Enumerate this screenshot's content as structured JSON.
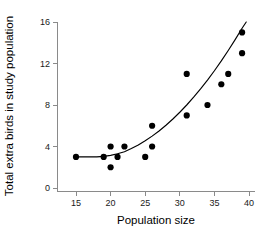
{
  "chart_data": {
    "type": "scatter",
    "title": "",
    "xlabel": "Population size",
    "ylabel": "Total extra birds in study population",
    "xlim": [
      13,
      41
    ],
    "ylim": [
      0,
      16
    ],
    "xticks": [
      15,
      20,
      25,
      30,
      35,
      40
    ],
    "yticks": [
      0,
      4,
      8,
      12,
      16
    ],
    "grid": false,
    "legend": null,
    "marker_color": "#000000",
    "axis_color": "#8a8a8a",
    "curve_color": "#000000",
    "x": [
      15,
      19,
      20,
      20,
      21,
      22,
      25,
      26,
      26,
      31,
      31,
      34,
      36,
      37,
      39,
      39
    ],
    "y": [
      3,
      3,
      4,
      2,
      3,
      4,
      3,
      6,
      4,
      11,
      7,
      8,
      10,
      11,
      15,
      13
    ],
    "points": [
      {
        "x": 15,
        "y": 3
      },
      {
        "x": 19,
        "y": 3
      },
      {
        "x": 20,
        "y": 4
      },
      {
        "x": 20,
        "y": 2
      },
      {
        "x": 21,
        "y": 3
      },
      {
        "x": 22,
        "y": 4
      },
      {
        "x": 25,
        "y": 3
      },
      {
        "x": 26,
        "y": 6
      },
      {
        "x": 26,
        "y": 4
      },
      {
        "x": 31,
        "y": 11
      },
      {
        "x": 31,
        "y": 7
      },
      {
        "x": 34,
        "y": 8
      },
      {
        "x": 36,
        "y": 10
      },
      {
        "x": 37,
        "y": 11
      },
      {
        "x": 39,
        "y": 15
      },
      {
        "x": 39,
        "y": 13
      }
    ],
    "fit_curve": {
      "name": "fitted exponential trend",
      "x": [
        15,
        16,
        17,
        18,
        19,
        20,
        21,
        22,
        23,
        24,
        25,
        26,
        27,
        28,
        29,
        30,
        31,
        32,
        33,
        34,
        35,
        36,
        37,
        38,
        39,
        39.6
      ],
      "y": [
        3.0,
        3.0,
        3.0,
        3.0,
        3.05,
        3.15,
        3.3,
        3.5,
        3.8,
        4.15,
        4.55,
        5.0,
        5.5,
        6.05,
        6.65,
        7.3,
        8.0,
        8.75,
        9.55,
        10.4,
        11.3,
        12.25,
        13.25,
        14.3,
        15.4,
        16.0
      ]
    }
  },
  "ticks": {
    "x": [
      "15",
      "20",
      "25",
      "30",
      "35",
      "40"
    ],
    "y": [
      "0",
      "4",
      "8",
      "12",
      "16"
    ]
  },
  "labels": {
    "xaxis": "Population size",
    "yaxis": "Total extra birds in study population"
  }
}
